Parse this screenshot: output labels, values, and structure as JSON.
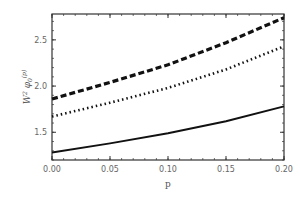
{
  "chart_data": {
    "type": "line",
    "title": "",
    "xlabel": "p",
    "ylabel": "W^2 φ0(p)",
    "xlim": [
      0.0,
      0.2
    ],
    "ylim": [
      1.2,
      2.78
    ],
    "grid": false,
    "legend": null,
    "x_ticks": [
      "0.00",
      "0.05",
      "0.10",
      "0.15",
      "0.20"
    ],
    "y_ticks": [
      "1.5",
      "2.0",
      "2.5"
    ],
    "x": [
      0.0,
      0.05,
      0.1,
      0.15,
      0.2
    ],
    "series": [
      {
        "name": "dashed",
        "style": "dashed",
        "values": [
          1.86,
          2.04,
          2.23,
          2.47,
          2.74
        ]
      },
      {
        "name": "dotted",
        "style": "dotted",
        "values": [
          1.67,
          1.82,
          1.98,
          2.18,
          2.43
        ]
      },
      {
        "name": "solid",
        "style": "solid",
        "values": [
          1.28,
          1.38,
          1.49,
          1.62,
          1.78
        ]
      }
    ]
  }
}
